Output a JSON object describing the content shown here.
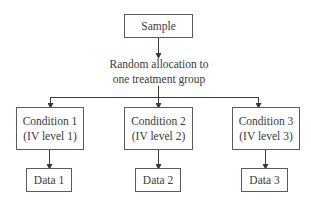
{
  "diagram": {
    "type": "flowchart",
    "root": {
      "label": "Sample"
    },
    "allocation": {
      "line1": "Random allocation to",
      "line2": "one treatment group"
    },
    "conditions": [
      {
        "title": "Condition 1",
        "subtitle": "(IV level 1)",
        "data": "Data 1"
      },
      {
        "title": "Condition 2",
        "subtitle": "(IV level 2)",
        "data": "Data 2"
      },
      {
        "title": "Condition 3",
        "subtitle": "(IV level 3)",
        "data": "Data 3"
      }
    ],
    "colors": {
      "line": "#3a3a3a",
      "border": "#5a5a5a",
      "text": "#3a3a3a",
      "background": "#ffffff"
    }
  }
}
